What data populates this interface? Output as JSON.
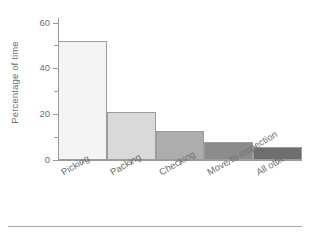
{
  "chart_data": {
    "type": "bar",
    "title": "",
    "subtitle": "",
    "xlabel": "",
    "ylabel": "Percentage of time",
    "categories": [
      "Picking",
      "Packing",
      "Checking",
      "Move to inspection",
      "All others"
    ],
    "values": [
      52,
      21,
      12.5,
      8,
      5.5
    ],
    "series": [
      {
        "name": "Percentage of time",
        "values": [
          52,
          21,
          12.5,
          8,
          5.5
        ]
      }
    ],
    "bar_colors": [
      "#f4f4f4",
      "#d9d9d9",
      "#adadad",
      "#8c8c8c",
      "#6e6e6e"
    ],
    "bar_edge_color": "#9c9c9c",
    "ylim": [
      0,
      62
    ],
    "yticks_major": [
      0,
      20,
      40,
      60
    ],
    "yticks_minor": [
      10,
      30,
      50
    ],
    "ytick_labels": [
      "0",
      "20",
      "40",
      "60"
    ],
    "grid": false,
    "legend": null,
    "legend_position": "none",
    "axis_color": "#9a9a9a",
    "text_color": "#6f6f6f",
    "background": "#ffffff",
    "xlabel_rotation_deg": -30,
    "annotations": []
  },
  "figure": {
    "footer_rule_color": "#a8a8a8"
  }
}
